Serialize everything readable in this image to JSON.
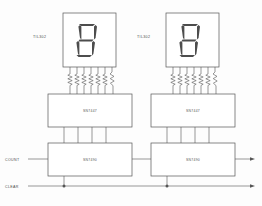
{
  "diagram": {
    "line_color": "#555555",
    "fill_color": "#ffffff",
    "text_color": "#4a4a4a",
    "segment_color": "#4d4d4d",
    "background": "#fdfdfd"
  },
  "signals": {
    "count_label": "COUNT",
    "clear_label": "CLEAR"
  },
  "stages": [
    {
      "id": "units",
      "display_label": "TIL302",
      "display_value": "8",
      "decoder_label": "SN7447",
      "counter_label": "SN7490",
      "resistor_count": 7,
      "bcd_lines": 4
    },
    {
      "id": "tens",
      "display_label": "TIL302",
      "display_value": "8",
      "decoder_label": "SN7447",
      "counter_label": "SN7490",
      "resistor_count": 7,
      "bcd_lines": 4
    }
  ],
  "segments": {
    "names": [
      "a",
      "b",
      "c",
      "d",
      "e",
      "f",
      "g"
    ],
    "active": [
      "a",
      "b",
      "c",
      "d",
      "e",
      "f",
      "g"
    ]
  }
}
